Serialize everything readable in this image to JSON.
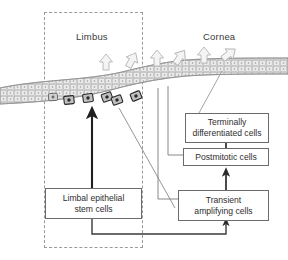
{
  "figure": {
    "type": "biological-schematic",
    "title_visible": false,
    "background_color": "#ffffff",
    "width": 288,
    "height": 260
  },
  "regions": [
    {
      "name": "limbus",
      "label": "Limbus",
      "dashed_box": true
    },
    {
      "name": "cornea",
      "label": "Cornea",
      "dashed_box": false
    }
  ],
  "labels": {
    "limbus": "Limbus",
    "cornea": "Cornea"
  },
  "nodes": [
    {
      "id": "terminally-differentiated-cells",
      "line1": "Terminally",
      "line2": "differentiated cells"
    },
    {
      "id": "postmitotic-cells",
      "line1": "Postmitotic cells",
      "line2": ""
    },
    {
      "id": "transient-amplifying-cells",
      "line1": "Transient",
      "line2": "amplifying cells"
    },
    {
      "id": "limbal-epithelial-stem-cells",
      "line1": "Limbal epithelial",
      "line2": "stem cells"
    }
  ],
  "colors": {
    "box_border": "#6b6b6b",
    "box_fill": "#ffffff",
    "text": "#2e2e2e",
    "label_text": "#3a3a3a",
    "dashed_border": "#9a9a9a",
    "epithelium_fill": "#e8e8e8",
    "epithelium_stroke": "#8c8c8c",
    "stem_cell_fill": "#b5b5b5",
    "stem_cell_stroke": "#2b2b2b",
    "connector_line": "#5a5a5a",
    "thick_arrow": "#1f1f1f",
    "migration_arrow_stroke": "#b0b0b0",
    "migration_arrow_fill": "#f2f2f2"
  },
  "graphics": {
    "migration_arrow_count": 6,
    "stem_cell_count": 6,
    "epithelium_layers": 3,
    "arrow_direction": "upward-and-rightward migration"
  }
}
